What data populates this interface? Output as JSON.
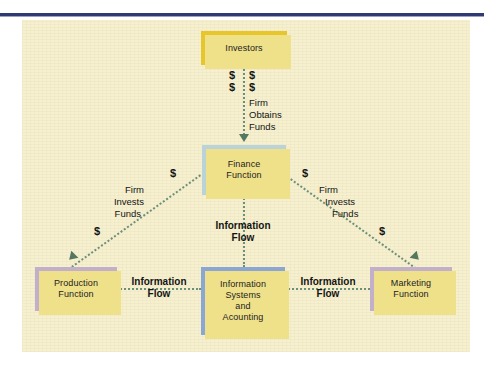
{
  "diagram": {
    "colors": {
      "top_rule": "#2e3b72",
      "panel_background": "#f6f0cf",
      "investors_box": "#e7c62c",
      "finance_box": "#b9d3d9",
      "production_box": "#c2b0cb",
      "information_systems_box": "#8ba6d2",
      "marketing_box": "#c2b0cb",
      "box_shadow": "#efe08a",
      "connector_line": "#6c8f7a",
      "arrow_head": "#55775f",
      "text": "#141414"
    },
    "nodes": [
      {
        "id": "investors",
        "label": "Investors",
        "lines": [
          "Investors"
        ]
      },
      {
        "id": "finance",
        "label": "Finance Function",
        "lines": [
          "Finance",
          "Function"
        ]
      },
      {
        "id": "production",
        "label": "Production Function",
        "lines": [
          "Production",
          "Function"
        ]
      },
      {
        "id": "isa",
        "label": "Information Systems and Acounting",
        "lines": [
          "Information",
          "Systems",
          "and",
          "Acounting"
        ]
      },
      {
        "id": "marketing",
        "label": "Marketing Function",
        "lines": [
          "Marketing",
          "Function"
        ]
      }
    ],
    "flows": {
      "investors_to_finance": {
        "money_left_top": "$",
        "money_left_bottom": "$",
        "money_right_top": "$",
        "money_right_bottom": "$",
        "caption_line1": "Firm",
        "caption_line2": "Obtains",
        "caption_line3": "Funds"
      },
      "finance_to_production": {
        "money_upper": "$",
        "money_lower": "$",
        "caption_line1": "Firm",
        "caption_line2": "Invests",
        "caption_line3": "Funds"
      },
      "finance_to_marketing": {
        "money_upper": "$",
        "money_lower": "$",
        "caption_line1": "Firm",
        "caption_line2": "Invests",
        "caption_line3": "Funds"
      },
      "finance_to_isa": {
        "caption_line1": "Information",
        "caption_line2": "Flow"
      },
      "production_to_isa": {
        "caption_line1": "Information",
        "caption_line2": "Flow"
      },
      "isa_to_marketing": {
        "caption_line1": "Information",
        "caption_line2": "Flow"
      }
    }
  }
}
